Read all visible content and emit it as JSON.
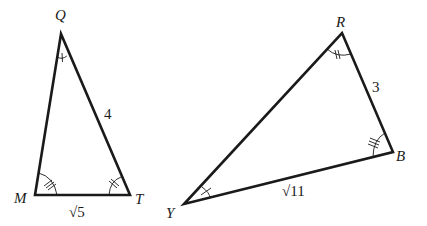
{
  "diagram": {
    "type": "similar-triangles",
    "triangles": [
      {
        "name": "QMT",
        "vertices": {
          "Q": {
            "label": "Q",
            "x": 61,
            "y": 34
          },
          "M": {
            "label": "M",
            "x": 35,
            "y": 195
          },
          "T": {
            "label": "T",
            "x": 130,
            "y": 195
          }
        },
        "sides": {
          "QT": {
            "label": "4"
          },
          "MT": {
            "label": "√5"
          }
        },
        "angle_marks": {
          "Q": 1,
          "M": 3,
          "T": 2
        }
      },
      {
        "name": "RBY",
        "vertices": {
          "R": {
            "label": "R",
            "x": 342,
            "y": 33
          },
          "B": {
            "label": "B",
            "x": 393,
            "y": 152
          },
          "Y": {
            "label": "Y",
            "x": 184,
            "y": 204
          }
        },
        "sides": {
          "RB": {
            "label": "3"
          },
          "YB": {
            "label": "√11"
          }
        },
        "angle_marks": {
          "R": 2,
          "B": 3,
          "Y": 1
        }
      }
    ],
    "colors": {
      "stroke": "#1a1a1a",
      "background": "#ffffff"
    }
  }
}
